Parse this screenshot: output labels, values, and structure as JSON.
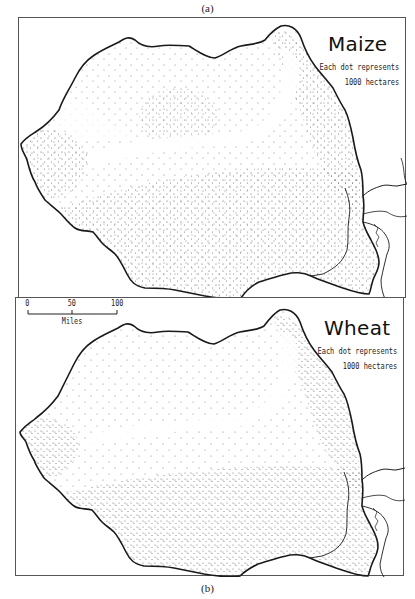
{
  "figure": {
    "caption_top": "(a)",
    "caption_bottom": "(b)"
  },
  "maps": [
    {
      "id": "a",
      "title": "Maize",
      "legend_line1": "Each dot represents",
      "legend_line2": "1000 hectares"
    },
    {
      "id": "b",
      "title": "Wheat",
      "legend_line1": "Each dot represents",
      "legend_line2": "1000 hectares",
      "scale_bar": {
        "ticks": [
          "0",
          "50",
          "100"
        ],
        "unit": "Miles"
      }
    }
  ],
  "colors": {
    "outline": "#1a1a1a",
    "dots": "#555555",
    "frame": "#555555",
    "background": "#ffffff"
  }
}
